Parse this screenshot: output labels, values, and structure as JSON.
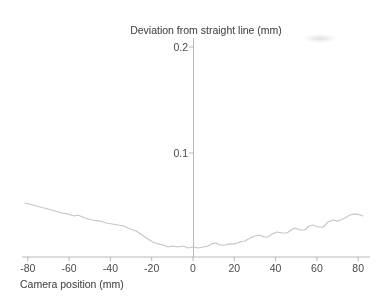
{
  "window": {
    "width": 387,
    "height": 305
  },
  "colors": {
    "background": "#ffffff",
    "axis": "#b2b2b2",
    "text": "#4b4b4b",
    "curve": "#c5c5c5"
  },
  "chart_data": {
    "type": "line",
    "title": "Deviation from straight line (mm)",
    "xlabel": "Camera position (mm)",
    "ylabel": "Deviation from straight line (mm)",
    "x_ticks": [
      -80,
      -60,
      -40,
      -20,
      0,
      20,
      40,
      60,
      80
    ],
    "x_tick_labels": [
      "-80",
      "-60",
      "-40",
      "-20",
      "0",
      "20",
      "40",
      "60",
      "80"
    ],
    "y_ticks": [
      0.1,
      0.2
    ],
    "y_tick_labels": [
      "0.1",
      "0.2"
    ],
    "xlim": [
      -83,
      85
    ],
    "ylim": [
      0,
      0.215
    ],
    "grid": false,
    "legend_position": "none",
    "series": [
      {
        "name": "measured deviation",
        "color": "#c5c5c5",
        "x": [
          -81.4,
          -77.5,
          -74.1,
          -70.2,
          -66.8,
          -63.4,
          -60.5,
          -57.6,
          -55.7,
          -52.3,
          -48.9,
          -45.0,
          -42.1,
          -39.2,
          -36.3,
          -33.4,
          -30.5,
          -27.6,
          -24.7,
          -21.8,
          -19.4,
          -16.9,
          -14.5,
          -12.1,
          -9.7,
          -7.3,
          -4.8,
          -2.4,
          0.0,
          2.4,
          4.8,
          7.3,
          9.2,
          11.1,
          13.1,
          15.5,
          17.9,
          20.3,
          22.8,
          25.2,
          27.6,
          30.0,
          32.4,
          34.4,
          36.3,
          38.3,
          40.7,
          43.1,
          45.5,
          47.5,
          49.4,
          51.8,
          54.2,
          56.2,
          58.1,
          60.5,
          63.0,
          65.4,
          67.8,
          70.2,
          73.6,
          76.0,
          78.5,
          80.9,
          82.3
        ],
        "y": [
          0.0528,
          0.0509,
          0.0491,
          0.0472,
          0.0453,
          0.0434,
          0.0425,
          0.0406,
          0.0415,
          0.0387,
          0.0368,
          0.0358,
          0.034,
          0.033,
          0.0321,
          0.0311,
          0.0283,
          0.0264,
          0.0226,
          0.0189,
          0.016,
          0.0142,
          0.0132,
          0.0113,
          0.0123,
          0.0113,
          0.0123,
          0.0104,
          0.0113,
          0.0104,
          0.0113,
          0.0123,
          0.0142,
          0.0151,
          0.0132,
          0.0132,
          0.0142,
          0.0142,
          0.016,
          0.017,
          0.0198,
          0.0217,
          0.0226,
          0.0208,
          0.0208,
          0.0236,
          0.0255,
          0.0245,
          0.0245,
          0.0274,
          0.0292,
          0.0274,
          0.0274,
          0.0311,
          0.0321,
          0.0302,
          0.0302,
          0.0349,
          0.0368,
          0.0358,
          0.0387,
          0.0415,
          0.0425,
          0.0415,
          0.0406
        ]
      }
    ]
  }
}
